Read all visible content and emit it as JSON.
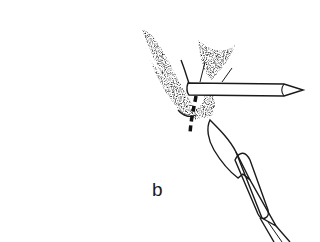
{
  "figure": {
    "panel_label": "b",
    "elements": [
      {
        "name": "tissue-shading",
        "description": "stippled tissue shading around insertion point"
      },
      {
        "name": "probe-needle",
        "description": "straight probe inserted horizontally, tip pointing right"
      },
      {
        "name": "incision-line",
        "description": "dashed vertical line indicating planned incision"
      },
      {
        "name": "scalpel",
        "description": "scalpel blade and handle approaching from lower right"
      }
    ],
    "colors": {
      "ink": "#1a1a1a",
      "background": "#ffffff"
    }
  }
}
